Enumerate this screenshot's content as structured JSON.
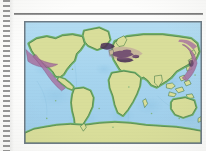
{
  "document": {
    "type": "scanned-textbook-page",
    "binding": "spiral-perforation-left-edge",
    "rule_present": true
  },
  "figure": {
    "name": "world-map",
    "frame_color": "#6d7b85",
    "caption": ""
  },
  "map": {
    "projection": "equirectangular",
    "ocean_color": "#a9d6ef",
    "land_color": "#d9de9a",
    "coast_color": "#3f7a42",
    "coast_band_color": "#6fb06a",
    "outline_color": "#2f6b3a",
    "highlight_color": "#a86fa0",
    "highlight_dark_color": "#4a2f55",
    "shelf_color": "#8fc6e4",
    "legend_visible": false,
    "graticule_visible": false,
    "labels_visible": false
  },
  "regions": {
    "continents": [
      {
        "id": "north-america",
        "label": "North America"
      },
      {
        "id": "south-america",
        "label": "South America"
      },
      {
        "id": "greenland",
        "label": "Greenland"
      },
      {
        "id": "europe",
        "label": "Europe"
      },
      {
        "id": "africa",
        "label": "Africa"
      },
      {
        "id": "asia",
        "label": "Asia"
      },
      {
        "id": "australia",
        "label": "Australia"
      },
      {
        "id": "antarctica",
        "label": "Antarctica"
      }
    ],
    "highlighted_zones": [
      {
        "id": "aleutian-alaska-arc",
        "label": "Aleutian / Alaska arc",
        "tone": "light"
      },
      {
        "id": "western-north-america-belt",
        "label": "Western North America belt",
        "tone": "light"
      },
      {
        "id": "mediterranean-alpine-belt",
        "label": "Mediterranean / Alpine belt",
        "tone": "dark"
      },
      {
        "id": "kamchatka-kuril-japan-arc",
        "label": "Kamchatka / Kuril / Japan arc",
        "tone": "light"
      },
      {
        "id": "north-atlantic-iceland-zone",
        "label": "North Atlantic / Iceland zone",
        "tone": "dark"
      }
    ]
  }
}
